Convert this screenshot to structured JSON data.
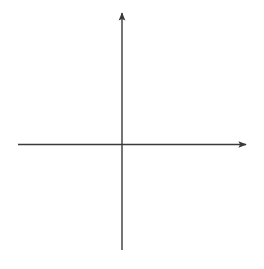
{
  "chart_data": {
    "type": "line",
    "title": "",
    "xlabel": "x",
    "ylabel": "y",
    "xlim": [
      -10,
      10
    ],
    "ylim": [
      -10,
      10
    ],
    "grid": true,
    "grid_style": "dotted",
    "grid_step": 2,
    "tick_labels": {
      "x": [
        "10"
      ],
      "y": [
        "10"
      ]
    },
    "legend": null,
    "series": [
      {
        "name": "curve",
        "arrows_at_ends": true,
        "points": [
          {
            "x": -3.8,
            "y": 10
          },
          {
            "x": -1.8,
            "y": 8
          },
          {
            "x": -1.0,
            "y": 6
          },
          {
            "x": -0.5,
            "y": 4
          },
          {
            "x": -0.2,
            "y": 2
          },
          {
            "x": 0,
            "y": 0
          },
          {
            "x": -0.7,
            "y": -2
          },
          {
            "x": -1.9,
            "y": -4
          },
          {
            "x": -3.6,
            "y": -6
          },
          {
            "x": -5.8,
            "y": -8
          },
          {
            "x": -9.0,
            "y": -10
          }
        ]
      }
    ]
  },
  "labels": {
    "x_axis": "x",
    "y_axis": "y",
    "x_tick": "10",
    "y_tick": "10"
  },
  "colors": {
    "axis": "#3a3a3a",
    "grid": "#8a8a8a",
    "curve": "#1e1e1e"
  }
}
